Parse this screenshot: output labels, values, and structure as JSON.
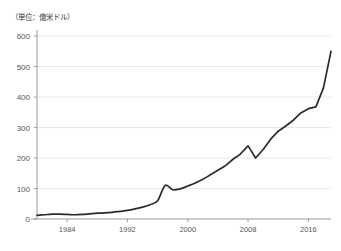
{
  "chart_data": {
    "type": "line",
    "title": "",
    "unit_note": "（単位：億米ドル）",
    "xlabel": "",
    "ylabel": "",
    "xlim": [
      1980,
      2019
    ],
    "ylim": [
      0,
      620
    ],
    "grid": true,
    "legend": false,
    "y_ticks": [
      0,
      100,
      200,
      300,
      400,
      500,
      600
    ],
    "y_tick_labels": [
      "0",
      "100",
      "200",
      "300",
      "400",
      "500",
      "600"
    ],
    "x_ticks": [
      1984,
      1992,
      2000,
      2008,
      2016
    ],
    "x_tick_labels": [
      "1984",
      "1992",
      "2000",
      "2008",
      "2016"
    ],
    "line_color": "#2b2b2b",
    "grid_color": "#e8e8e8",
    "axis_color": "#9a9a9a",
    "series": [
      {
        "name": "value",
        "x": [
          1980,
          1981,
          1982,
          1983,
          1984,
          1985,
          1986,
          1987,
          1988,
          1989,
          1990,
          1991,
          1992,
          1993,
          1994,
          1995,
          1996,
          1997,
          1998,
          1999,
          2000,
          2001,
          2002,
          2003,
          2004,
          2005,
          2006,
          2007,
          2008,
          2009,
          2010,
          2011,
          2012,
          2013,
          2014,
          2015,
          2016,
          2017,
          2018,
          2019
        ],
        "values": [
          12,
          14,
          16,
          16,
          15,
          14,
          15,
          17,
          19,
          20,
          22,
          25,
          28,
          33,
          39,
          47,
          60,
          110,
          96,
          99,
          108,
          118,
          130,
          145,
          160,
          175,
          196,
          214,
          240,
          200,
          228,
          262,
          288,
          305,
          324,
          348,
          362,
          368,
          430,
          550
        ]
      }
    ]
  }
}
